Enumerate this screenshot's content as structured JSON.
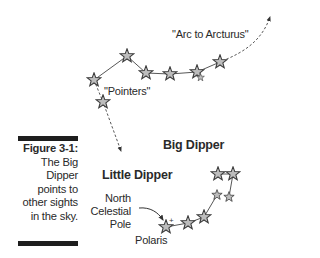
{
  "figure": {
    "number_label": "Figure 3-1:",
    "caption_lines": [
      "The Big",
      "Dipper",
      "points to",
      "other sights",
      "in the sky."
    ]
  },
  "labels": {
    "arc": "\"Arc to Arcturus\"",
    "pointers": "\"Pointers\"",
    "big_dipper": "Big Dipper",
    "little_dipper": "Little Dipper",
    "ncp_line1": "North",
    "ncp_line2": "Celestial",
    "ncp_line3": "Pole",
    "polaris": "Polaris"
  },
  "colors": {
    "star_fill": "#bdbdbd",
    "star_stroke": "#3a3a3a",
    "line": "#444444",
    "text": "#2a2a2a"
  }
}
